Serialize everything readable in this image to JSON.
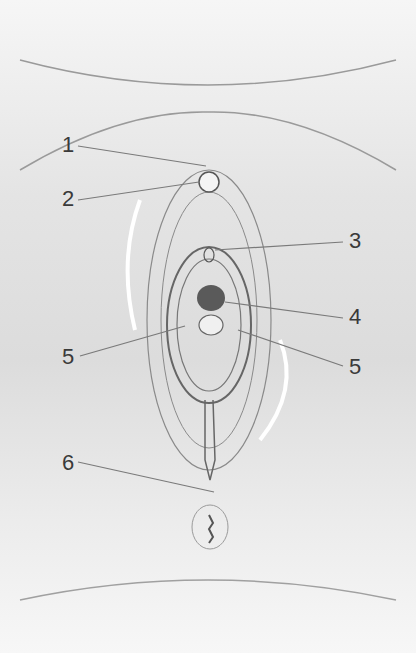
{
  "diagram": {
    "type": "anatomical-schematic",
    "style": "simplified line art, grayscale",
    "labels": [
      {
        "id": "1",
        "text": "1",
        "x": 62,
        "y": 138
      },
      {
        "id": "2",
        "text": "2",
        "x": 62,
        "y": 190
      },
      {
        "id": "3",
        "text": "3",
        "x": 349,
        "y": 232
      },
      {
        "id": "4",
        "text": "4",
        "x": 349,
        "y": 307
      },
      {
        "id": "5a",
        "text": "5",
        "x": 62,
        "y": 348
      },
      {
        "id": "5b",
        "text": "5",
        "x": 349,
        "y": 357
      },
      {
        "id": "6",
        "text": "6",
        "x": 62,
        "y": 455
      }
    ],
    "colors": {
      "line": "#6a6a6a",
      "leader": "#7a7a7a",
      "highlight": "#ffffff",
      "label": "#3a3a3a"
    }
  }
}
